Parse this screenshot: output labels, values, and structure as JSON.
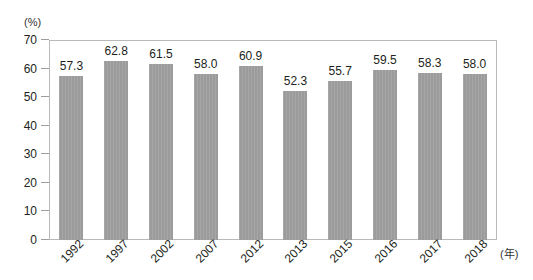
{
  "chart_data": {
    "type": "bar",
    "title": "",
    "subtitle": "",
    "xlabel": "(年)",
    "ylabel": "(%)",
    "categories": [
      "1992",
      "1997",
      "2002",
      "2007",
      "2012",
      "2013",
      "2015",
      "2016",
      "2017",
      "2018"
    ],
    "values": [
      57.3,
      62.8,
      61.5,
      58.0,
      60.9,
      52.3,
      55.7,
      59.5,
      58.3,
      58.0
    ],
    "value_labels": [
      "57.3",
      "62.8",
      "61.5",
      "58.0",
      "60.9",
      "52.3",
      "55.7",
      "59.5",
      "58.3",
      "58.0"
    ],
    "ylim": [
      0,
      70
    ],
    "ytick_step": 10,
    "ytick_labels": [
      "70",
      "60",
      "50",
      "40",
      "30",
      "20",
      "10",
      "0"
    ],
    "ytick_values": [
      70,
      60,
      50,
      40,
      30,
      20,
      10,
      0
    ],
    "grid": false,
    "legend": null,
    "legend_position": "none",
    "series": [
      {
        "name": "",
        "values": [
          57.3,
          62.8,
          61.5,
          58.0,
          60.9,
          52.3,
          55.7,
          59.5,
          58.3,
          58.0
        ]
      }
    ],
    "colors": {
      "bar": "#9d9d9d",
      "frame": "#b9b9b9",
      "text": "#231f20",
      "background": "#ffffff"
    }
  }
}
